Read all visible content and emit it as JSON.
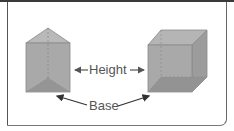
{
  "figure": {
    "labels": {
      "height": "Height",
      "base": "Base"
    },
    "shapes": [
      "triangular-prism",
      "cube"
    ],
    "colors": {
      "face": "#a8a8a8",
      "face_top": "#b8b8b8",
      "face_side": "#9a9a9a",
      "base_face": "#8e8e8e",
      "edge": "#7a7a7a",
      "text": "#555555",
      "arrow": "#333333"
    }
  }
}
